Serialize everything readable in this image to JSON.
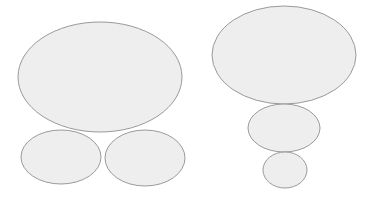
{
  "diagram": {
    "background": "#ffffff",
    "fill": "#eeeeee",
    "stroke": "#9a9a9a",
    "stroke_width": 1,
    "groups": [
      {
        "name": "left-group",
        "arrangement": "one large ellipse above two side-by-side smaller ellipses",
        "shapes": [
          {
            "name": "large-ellipse",
            "cx": 100,
            "cy": 77,
            "rx": 82,
            "ry": 55
          },
          {
            "name": "bottom-left-ellipse",
            "cx": 61,
            "cy": 157,
            "rx": 40,
            "ry": 27
          },
          {
            "name": "bottom-right-ellipse",
            "cx": 145,
            "cy": 158,
            "rx": 40,
            "ry": 28
          }
        ]
      },
      {
        "name": "right-group",
        "arrangement": "three stacked ellipses decreasing in size from top to bottom",
        "shapes": [
          {
            "name": "top-ellipse",
            "cx": 284,
            "cy": 55,
            "rx": 72,
            "ry": 49
          },
          {
            "name": "middle-ellipse",
            "cx": 284,
            "cy": 128,
            "rx": 36,
            "ry": 24
          },
          {
            "name": "bottom-ellipse",
            "cx": 285,
            "cy": 170,
            "rx": 22,
            "ry": 18
          }
        ]
      }
    ]
  }
}
